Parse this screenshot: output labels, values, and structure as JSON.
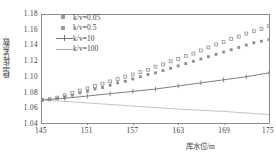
{
  "chart_data": {
    "type": "scatter",
    "title": "",
    "xlabel": "库水位/m",
    "ylabel": "稳定性系数",
    "xlim": [
      145,
      175
    ],
    "ylim": [
      1.04,
      1.18
    ],
    "xticks": [
      145,
      151,
      157,
      163,
      169,
      175
    ],
    "yticks": [
      "1.04",
      "1.06",
      "1.08",
      "1.10",
      "1.12",
      "1.14",
      "1.16",
      "1.18"
    ],
    "grid": false,
    "legend_position": "top-left",
    "series": [
      {
        "name": "k/v=0.05",
        "marker": "open-square",
        "color": "#9a9a9a",
        "x": [
          145,
          146,
          147,
          148,
          149,
          150,
          151,
          152,
          153,
          154,
          155,
          156,
          157,
          158,
          159,
          160,
          161,
          162,
          163,
          164,
          165,
          166,
          167,
          168,
          169,
          170,
          171,
          172,
          173,
          174,
          175
        ],
        "values": [
          1.07,
          1.071,
          1.073,
          1.076,
          1.079,
          1.082,
          1.085,
          1.088,
          1.091,
          1.094,
          1.097,
          1.1,
          1.103,
          1.106,
          1.109,
          1.113,
          1.116,
          1.12,
          1.123,
          1.127,
          1.13,
          1.134,
          1.138,
          1.142,
          1.145,
          1.149,
          1.152,
          1.156,
          1.159,
          1.162,
          1.166
        ]
      },
      {
        "name": "k/v=0.5",
        "marker": "filled-square",
        "color": "#8f8f8f",
        "x": [
          145,
          146,
          147,
          148,
          149,
          150,
          151,
          152,
          153,
          154,
          155,
          156,
          157,
          158,
          159,
          160,
          161,
          162,
          163,
          164,
          165,
          166,
          167,
          168,
          169,
          170,
          171,
          172,
          173,
          174,
          175
        ],
        "values": [
          1.07,
          1.07,
          1.072,
          1.074,
          1.076,
          1.079,
          1.081,
          1.084,
          1.086,
          1.089,
          1.092,
          1.094,
          1.097,
          1.1,
          1.103,
          1.105,
          1.108,
          1.111,
          1.114,
          1.117,
          1.12,
          1.123,
          1.126,
          1.129,
          1.132,
          1.135,
          1.138,
          1.141,
          1.144,
          1.146,
          1.148
        ]
      },
      {
        "name": "k/v=10",
        "marker": "line-tick",
        "color": "#6f6f6f",
        "x": [
          145,
          148,
          151,
          154,
          157,
          160,
          163,
          166,
          169,
          172,
          175
        ],
        "values": [
          1.07,
          1.072,
          1.075,
          1.078,
          1.081,
          1.084,
          1.088,
          1.092,
          1.096,
          1.1,
          1.105
        ]
      },
      {
        "name": "k/v=100",
        "marker": "line",
        "color": "#a9a9a9",
        "x": [
          145,
          151,
          157,
          163,
          169,
          175
        ],
        "values": [
          1.07,
          1.066,
          1.062,
          1.058,
          1.055,
          1.051
        ]
      }
    ]
  }
}
